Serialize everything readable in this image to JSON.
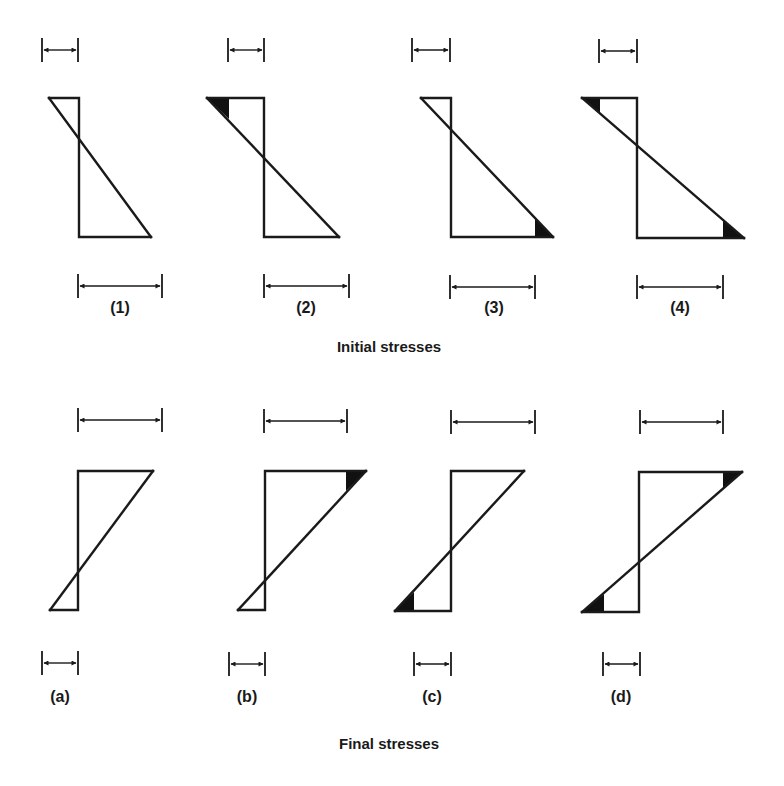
{
  "figure": {
    "initial": {
      "caption": "Initial stresses",
      "cases": [
        {
          "label": "(1)",
          "top_dim": "small",
          "bottom_dim": "large",
          "shaded": []
        },
        {
          "label": "(2)",
          "top_dim": "small",
          "bottom_dim": "large",
          "shaded": [
            "top-left"
          ]
        },
        {
          "label": "(3)",
          "top_dim": "small",
          "bottom_dim": "large",
          "shaded": [
            "bottom-right"
          ]
        },
        {
          "label": "(4)",
          "top_dim": "small",
          "bottom_dim": "large",
          "shaded": [
            "top-left",
            "bottom-right"
          ]
        }
      ]
    },
    "final": {
      "caption": "Final stresses",
      "cases": [
        {
          "label": "(a)",
          "top_dim": "large",
          "bottom_dim": "small",
          "shaded": []
        },
        {
          "label": "(b)",
          "top_dim": "large",
          "bottom_dim": "small",
          "shaded": [
            "top-right"
          ]
        },
        {
          "label": "(c)",
          "top_dim": "large",
          "bottom_dim": "small",
          "shaded": [
            "bottom-left"
          ]
        },
        {
          "label": "(d)",
          "top_dim": "large",
          "bottom_dim": "small",
          "shaded": [
            "top-right",
            "bottom-left"
          ]
        }
      ]
    },
    "colors": {
      "ink": "#1a1a1a",
      "background": "#ffffff"
    }
  }
}
